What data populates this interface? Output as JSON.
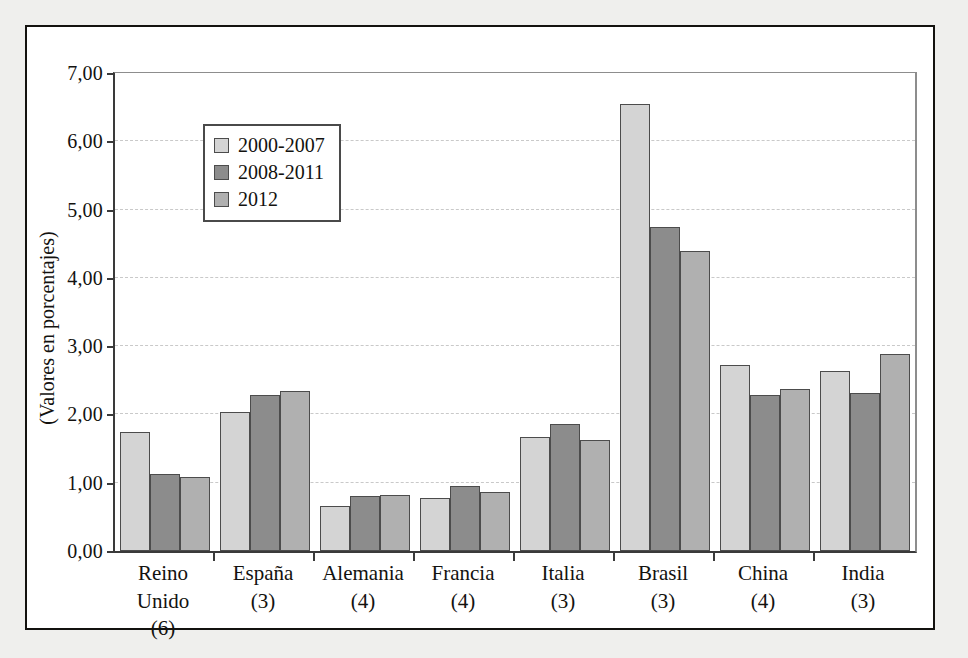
{
  "chart_data": {
    "type": "bar",
    "title": "",
    "xlabel": "",
    "ylabel": "(Valores en porcentajes)",
    "ylim": [
      0,
      7
    ],
    "ytick_step": 1,
    "ytick_labels": [
      "0,00",
      "1,00",
      "2,00",
      "3,00",
      "4,00",
      "5,00",
      "6,00",
      "7,00"
    ],
    "grid": true,
    "legend_position": "upper-left-inside",
    "categories": [
      "Reino Unido",
      "España",
      "Alemania",
      "Francia",
      "Italia",
      "Brasil",
      "China",
      "India"
    ],
    "category_counts": [
      "(6)",
      "(3)",
      "(4)",
      "(4)",
      "(3)",
      "(3)",
      "(4)",
      "(3)"
    ],
    "series": [
      {
        "name": "2000-2007",
        "color": "#d4d4d4",
        "values": [
          1.75,
          2.03,
          0.66,
          0.78,
          1.67,
          6.55,
          2.72,
          2.64
        ]
      },
      {
        "name": "2008-2011",
        "color": "#8c8c8c",
        "values": [
          1.13,
          2.29,
          0.8,
          0.95,
          1.86,
          4.75,
          2.29,
          2.32
        ]
      },
      {
        "name": "2012",
        "color": "#b0b0b0",
        "values": [
          1.08,
          2.35,
          0.82,
          0.87,
          1.63,
          4.4,
          2.37,
          2.88
        ]
      }
    ]
  }
}
